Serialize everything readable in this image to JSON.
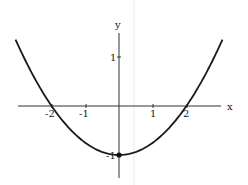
{
  "chart_data": {
    "type": "line",
    "title": "",
    "xlabel": "x",
    "ylabel": "y",
    "function": "y = x^2/4 - 1",
    "xlim": [
      -3.1,
      3.1
    ],
    "ylim": [
      -1.5,
      1.5
    ],
    "x_ticks": [
      -2,
      -1,
      1,
      2
    ],
    "x_tick_labels": [
      "-2",
      "-1",
      "1",
      "2"
    ],
    "y_ticks": [
      1,
      -1
    ],
    "y_tick_labels": [
      "1",
      "-1"
    ],
    "grid": false,
    "legend": null,
    "series": [
      {
        "name": "parabola",
        "x": [
          -3.0,
          -2.5,
          -2.0,
          -1.5,
          -1.0,
          -0.5,
          0.0,
          0.5,
          1.0,
          1.5,
          2.0,
          2.5,
          3.0
        ],
        "y": [
          1.25,
          0.5625,
          0.0,
          -0.4375,
          -0.75,
          -0.9375,
          -1.0,
          -0.9375,
          -0.75,
          -0.4375,
          0.0,
          0.5625,
          1.25
        ]
      }
    ],
    "annotations": [
      {
        "type": "point",
        "x": 0,
        "y": -1,
        "label": "vertex"
      }
    ]
  },
  "labels": {
    "x_axis": "x",
    "y_axis": "y",
    "x_ticks": [
      "-2",
      "-1",
      "1",
      "2"
    ],
    "y_ticks": [
      "1",
      "-1"
    ]
  },
  "colors": {
    "curve": "#1a1a1a",
    "axis": "#333333",
    "artifact_line": "#e6e6e6"
  }
}
